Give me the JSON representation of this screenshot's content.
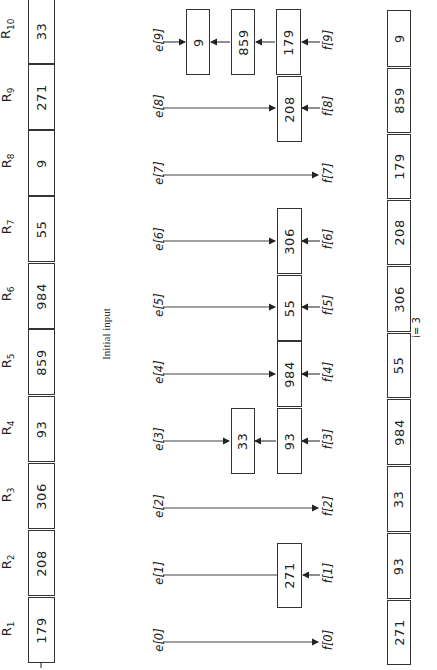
{
  "figure": {
    "orientation": "rotated-90-ccw",
    "initial_input": {
      "caption": "Initial input",
      "records": [
        {
          "label": "R",
          "index": "1",
          "key": "179"
        },
        {
          "label": "R",
          "index": "2",
          "key": "208"
        },
        {
          "label": "R",
          "index": "3",
          "key": "306"
        },
        {
          "label": "R",
          "index": "4",
          "key": "93"
        },
        {
          "label": "R",
          "index": "5",
          "key": "859"
        },
        {
          "label": "R",
          "index": "6",
          "key": "984"
        },
        {
          "label": "R",
          "index": "7",
          "key": "55"
        },
        {
          "label": "R",
          "index": "8",
          "key": "9"
        },
        {
          "label": "R",
          "index": "9",
          "key": "271"
        },
        {
          "label": "R",
          "index": "10",
          "key": "33"
        }
      ]
    },
    "buckets": [
      {
        "e": "e[0]",
        "f": "f[0]",
        "keys": []
      },
      {
        "e": "e[1]",
        "f": "f[1]",
        "keys": [
          "271"
        ]
      },
      {
        "e": "e[2]",
        "f": "f[2]",
        "keys": []
      },
      {
        "e": "e[3]",
        "f": "f[3]",
        "keys": [
          "93",
          "33"
        ]
      },
      {
        "e": "e[4]",
        "f": "f[4]",
        "keys": [
          "984"
        ]
      },
      {
        "e": "e[5]",
        "f": "f[5]",
        "keys": [
          "55"
        ]
      },
      {
        "e": "e[6]",
        "f": "f[6]",
        "keys": [
          "306"
        ]
      },
      {
        "e": "e[7]",
        "f": "f[7]",
        "keys": []
      },
      {
        "e": "e[8]",
        "f": "f[8]",
        "keys": [
          "208"
        ]
      },
      {
        "e": "e[9]",
        "f": "f[9]",
        "keys": [
          "179",
          "859",
          "9"
        ]
      }
    ],
    "output": {
      "keys": [
        "271",
        "93",
        "33",
        "984",
        "55",
        "306",
        "208",
        "179",
        "859",
        "9"
      ],
      "pass_label": "i= 3"
    }
  }
}
